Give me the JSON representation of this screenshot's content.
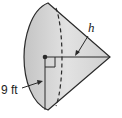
{
  "diagram": {
    "type": "cone",
    "orientation": "lying on side, apex pointing right",
    "labels": {
      "radius": "9 ft",
      "slant_height": "h"
    },
    "colors": {
      "fill": "#d6d6d6",
      "stroke": "#2a2a2a"
    },
    "features": [
      "center point",
      "right-angle marker",
      "dashed hidden base edge",
      "radius line",
      "height line"
    ]
  }
}
